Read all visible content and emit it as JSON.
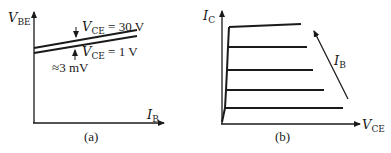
{
  "panel_a": {
    "caption": "(a)",
    "y_axis": {
      "main": "V",
      "sub": "BE"
    },
    "x_axis": {
      "main": "I",
      "sub": "B"
    },
    "curves": [
      {
        "label_main": "V",
        "label_sub": "CE",
        "label_value": " = 30 V"
      },
      {
        "label_main": "V",
        "label_sub": "CE",
        "label_value": " = 1 V"
      }
    ],
    "gap_annotation": "≈3 mV"
  },
  "panel_b": {
    "caption": "(b)",
    "y_axis": {
      "main": "I",
      "sub": "C"
    },
    "x_axis": {
      "main": "V",
      "sub": "CE"
    },
    "arrow_label": {
      "main": "I",
      "sub": "B"
    },
    "curve_count": 5
  }
}
